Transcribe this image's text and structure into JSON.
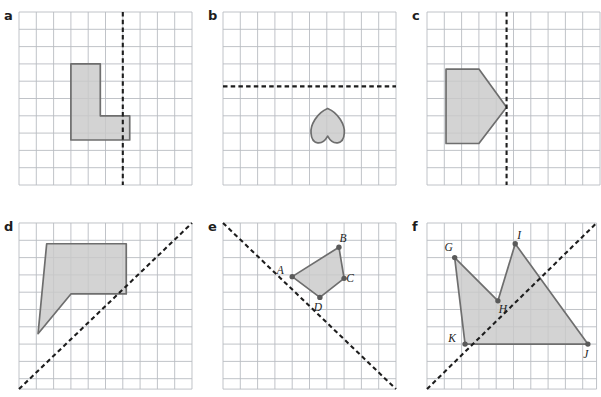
{
  "figure": {
    "title_visible": false,
    "background_color": "#ffffff",
    "grid_line_color": "#b9bcc2",
    "grid_minor_color": "#d8dadd",
    "shape_fill_color": "#c9c9c9",
    "shape_stroke_color": "#6e6e6e",
    "mirror_line_color": "#1d1d1d",
    "vertex_dot_color": "#5a5a5a",
    "cell_size_px": 17.3
  },
  "panels": [
    {
      "id": "a",
      "letter": "a",
      "x": 18,
      "y": 11,
      "cols": 10,
      "rows": 10,
      "mirror": {
        "type": "vertical",
        "kind": "dashed",
        "x_cells": 6
      },
      "shape": {
        "name": "l-shape-polygon",
        "kind": "polygon",
        "points_cells": [
          [
            3,
            3
          ],
          [
            4.7,
            3
          ],
          [
            4.7,
            6
          ],
          [
            6.4,
            6
          ],
          [
            6.4,
            7.4
          ],
          [
            3,
            7.4
          ]
        ]
      },
      "vertices": []
    },
    {
      "id": "b",
      "letter": "b",
      "x": 222,
      "y": 11,
      "cols": 10,
      "rows": 10,
      "mirror": {
        "type": "horizontal",
        "kind": "dashed",
        "y_cells": 4.3
      },
      "shape": {
        "name": "heart-shape-inverted",
        "kind": "heart",
        "center_cells": [
          6.05,
          6.6
        ],
        "width_cells": 2.0,
        "height_cells": 2.05
      },
      "vertices": []
    },
    {
      "id": "c",
      "letter": "c",
      "x": 426,
      "y": 11,
      "cols": 10,
      "rows": 10,
      "mirror": {
        "type": "vertical",
        "kind": "dashed",
        "x_cells": 4.6
      },
      "shape": {
        "name": "pentagon-arrow-polygon",
        "kind": "polygon",
        "points_cells": [
          [
            1.1,
            3.3
          ],
          [
            3.0,
            3.3
          ],
          [
            4.6,
            5.5
          ],
          [
            3.0,
            7.6
          ],
          [
            1.1,
            7.6
          ]
        ]
      },
      "vertices": []
    },
    {
      "id": "d",
      "letter": "d",
      "x": 18,
      "y": 222,
      "cols": 10,
      "rows": 9.6,
      "mirror": {
        "type": "diagonal-up",
        "kind": "dashed"
      },
      "shape": {
        "name": "pentagon-flag-polygon",
        "kind": "polygon",
        "points_cells": [
          [
            1.6,
            1.2
          ],
          [
            6.2,
            1.2
          ],
          [
            6.2,
            4.1
          ],
          [
            3.0,
            4.1
          ],
          [
            1.1,
            6.4
          ]
        ]
      },
      "vertices": []
    },
    {
      "id": "e",
      "letter": "e",
      "x": 222,
      "y": 222,
      "cols": 10,
      "rows": 9.6,
      "mirror": {
        "type": "diagonal-down",
        "kind": "dashed"
      },
      "shape": {
        "name": "quadrilateral-abcd",
        "kind": "polygon",
        "points_cells": [
          [
            4.0,
            3.1
          ],
          [
            6.7,
            1.4
          ],
          [
            7.0,
            3.2
          ],
          [
            5.6,
            4.3
          ]
        ]
      },
      "vertices": [
        {
          "label": "A",
          "cell": [
            4.0,
            3.1
          ],
          "label_dx": -12,
          "label_dy": -3
        },
        {
          "label": "B",
          "cell": [
            6.7,
            1.4
          ],
          "label_dx": 4,
          "label_dy": -5
        },
        {
          "label": "C",
          "cell": [
            7.0,
            3.2
          ],
          "label_dx": 6,
          "label_dy": 4
        },
        {
          "label": "D",
          "cell": [
            5.6,
            4.3
          ],
          "label_dx": -2,
          "label_dy": 14
        }
      ]
    },
    {
      "id": "f",
      "letter": "f",
      "x": 426,
      "y": 222,
      "cols": 9.8,
      "rows": 9.6,
      "mirror": {
        "type": "diagonal-up",
        "kind": "dashed"
      },
      "shape": {
        "name": "crown-polygon-ghijk",
        "kind": "polygon",
        "points_cells": [
          [
            1.6,
            2.0
          ],
          [
            4.1,
            4.5
          ],
          [
            5.1,
            1.2
          ],
          [
            9.3,
            7.0
          ],
          [
            2.2,
            7.0
          ]
        ]
      },
      "vertices": [
        {
          "label": "G",
          "cell": [
            1.6,
            2.0
          ],
          "label_dx": -6,
          "label_dy": -7
        },
        {
          "label": "H",
          "cell": [
            4.1,
            4.5
          ],
          "label_dx": 5,
          "label_dy": 12
        },
        {
          "label": "I",
          "cell": [
            5.1,
            1.2
          ],
          "label_dx": 4,
          "label_dy": -5
        },
        {
          "label": "J",
          "cell": [
            9.3,
            7.0
          ],
          "label_dx": -2,
          "label_dy": 14
        },
        {
          "label": "K",
          "cell": [
            2.2,
            7.0
          ],
          "label_dx": -13,
          "label_dy": -2
        }
      ]
    }
  ]
}
